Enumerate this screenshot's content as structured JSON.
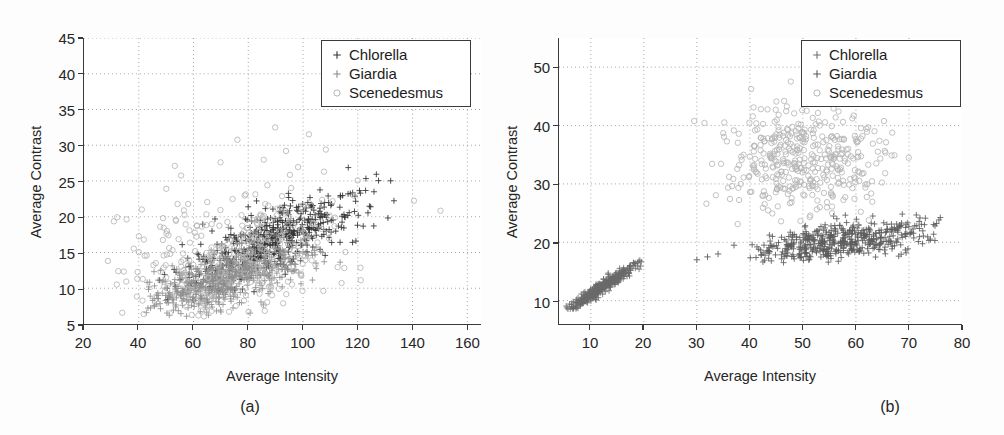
{
  "figure": {
    "panels": [
      {
        "id": "a",
        "caption": "(a)",
        "legend": {
          "entries": [
            {
              "label": "Chlorella",
              "marker": "plus",
              "color": "#333333"
            },
            {
              "label": "Giardia",
              "marker": "plus",
              "color": "#8a8a8a"
            },
            {
              "label": "Scenedesmus",
              "marker": "circle",
              "color": "#b4b4b4"
            }
          ]
        }
      },
      {
        "id": "b",
        "caption": "(b)",
        "legend": {
          "entries": [
            {
              "label": "Chlorella",
              "marker": "plus",
              "color": "#6f6f6f"
            },
            {
              "label": "Giardia",
              "marker": "plus",
              "color": "#5a5a5a"
            },
            {
              "label": "Scenedesmus",
              "marker": "circle",
              "color": "#b4b4b4"
            }
          ]
        }
      }
    ]
  },
  "chart_data": [
    {
      "type": "scatter",
      "panel": "a",
      "title": "",
      "xlabel": "Average Intensity",
      "ylabel": "Average Contrast",
      "xlim": [
        20,
        165
      ],
      "ylim": [
        5,
        45
      ],
      "xticks": [
        20,
        40,
        60,
        80,
        100,
        120,
        140,
        160
      ],
      "yticks": [
        5,
        10,
        15,
        20,
        25,
        30,
        35,
        40,
        45
      ],
      "grid": true,
      "grid_style": "dotted",
      "legend_position": "top-right",
      "series": [
        {
          "name": "Chlorella",
          "marker": "plus",
          "color": "#333333",
          "n_points": 520,
          "cluster": {
            "x_mean": 88,
            "x_std": 16,
            "y_mean": 16.5,
            "y_std": 3.2,
            "correlation": 0.74,
            "x_range": [
              45,
              150
            ],
            "y_range": [
              7,
              27
            ]
          }
        },
        {
          "name": "Giardia",
          "marker": "plus",
          "color": "#8f8f8f",
          "n_points": 640,
          "cluster": {
            "x_mean": 72,
            "x_std": 14,
            "y_mean": 11.5,
            "y_std": 2.4,
            "correlation": 0.62,
            "x_range": [
              40,
              115
            ],
            "y_range": [
              6,
              20
            ]
          }
        },
        {
          "name": "Scenedesmus",
          "marker": "circle",
          "color": "#b6b6b6",
          "n_points": 330,
          "cluster": {
            "x_mean": 74,
            "x_std": 24,
            "y_mean": 14.5,
            "y_std": 5.5,
            "correlation": 0.35,
            "x_range": [
              26,
              160
            ],
            "y_range": [
              6,
              44
            ]
          }
        }
      ]
    },
    {
      "type": "scatter",
      "panel": "b",
      "title": "",
      "xlabel": "Average Intensity",
      "ylabel": "Average Contrast",
      "xlim": [
        4,
        80
      ],
      "ylim": [
        6,
        55
      ],
      "xticks": [
        10,
        20,
        30,
        40,
        50,
        60,
        70,
        80
      ],
      "yticks": [
        10,
        20,
        30,
        40,
        50
      ],
      "grid": true,
      "grid_style": "dotted",
      "legend_position": "top-right",
      "series": [
        {
          "name": "Chlorella",
          "marker": "plus",
          "color": "#6b6b6b",
          "n_points": 430,
          "cluster": {
            "x_mean": 12,
            "x_std": 3.4,
            "y_mean": 12.2,
            "y_std": 2.1,
            "correlation": 0.97,
            "x_range": [
              5,
              20
            ],
            "y_range": [
              8.5,
              17
            ]
          }
        },
        {
          "name": "Giardia",
          "marker": "plus",
          "color": "#5c5c5c",
          "n_points": 520,
          "cluster": {
            "x_mean": 57,
            "x_std": 9,
            "y_mean": 20.2,
            "y_std": 1.9,
            "correlation": 0.55,
            "x_range": [
              40,
              76
            ],
            "y_range": [
              16.5,
              25.5
            ]
          }
        },
        {
          "name": "Scenedesmus",
          "marker": "circle",
          "color": "#b6b6b6",
          "n_points": 420,
          "cluster": {
            "x_mean": 50,
            "x_std": 8,
            "y_mean": 34,
            "y_std": 5,
            "correlation": 0.05,
            "x_range": [
              29,
              72
            ],
            "y_range": [
              23,
              49
            ]
          }
        }
      ],
      "outliers": [
        {
          "series": "Chlorella",
          "x": 30,
          "y": 17
        },
        {
          "series": "Chlorella",
          "x": 32,
          "y": 17.5
        },
        {
          "series": "Chlorella",
          "x": 34,
          "y": 18
        },
        {
          "series": "Chlorella",
          "x": 37,
          "y": 19.5
        }
      ]
    }
  ]
}
